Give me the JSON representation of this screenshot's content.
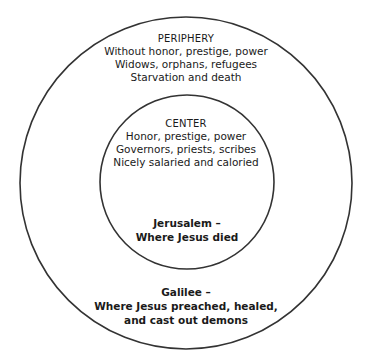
{
  "diagram": {
    "type": "concentric-circles",
    "stroke_color": "#333333",
    "background": "#ffffff",
    "outer_circle": {
      "cx": 186,
      "cy": 183,
      "r": 166,
      "heading": "PERIPHERY",
      "lines": [
        "Without honor, prestige, power",
        "Widows, orphans, refugees",
        "Starvation and death"
      ],
      "place_label": [
        "Galilee –",
        "Where Jesus preached, healed,",
        "and cast out demons"
      ]
    },
    "inner_circle": {
      "cx": 187,
      "cy": 182,
      "r": 87,
      "heading": "CENTER",
      "lines": [
        "Honor, prestige, power",
        "Governors, priests, scribes",
        "Nicely salaried and caloried"
      ],
      "place_label": [
        "Jerusalem –",
        "Where Jesus died"
      ]
    }
  }
}
